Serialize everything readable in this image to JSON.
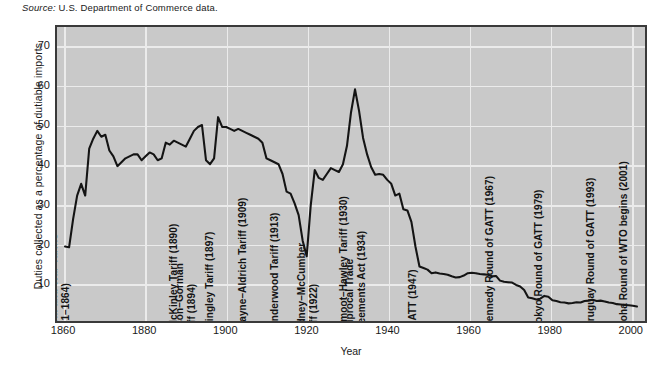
{
  "source_note": {
    "prefix": "Source:",
    "text": " U.S. Department of Commerce data."
  },
  "axes": {
    "y_title": "Duties collected as a percentage of dutiable imports",
    "x_title": "Year",
    "y_ticks": [
      "10",
      "20",
      "30",
      "40",
      "50",
      "60",
      "70"
    ],
    "x_ticks": [
      "1860",
      "1880",
      "1900",
      "1920",
      "1940",
      "1960",
      "1980",
      "2000"
    ]
  },
  "colors": {
    "plot_background": "#c9c9c9",
    "gridline": "#ebebeb",
    "border": "#3a3a3a",
    "series_line": "#141414",
    "text": "#1a1a1a"
  },
  "annotations": [
    {
      "label": "Morrill and War Tariffs\n(1861–1864)",
      "year": 1862,
      "lines": 2
    },
    {
      "label": "McKinley Tariff (1890)",
      "year": 1888,
      "lines": 1
    },
    {
      "label": "Wilson–Gorman\nTariff (1894)",
      "year": 1893,
      "lines": 2
    },
    {
      "label": "Dingley Tariff (1897)",
      "year": 1897,
      "lines": 1
    },
    {
      "label": "Payne–Aldrich Tariff (1909)",
      "year": 1905,
      "lines": 1
    },
    {
      "label": "Underwood Tariff (1913)",
      "year": 1913,
      "lines": 1
    },
    {
      "label": "Fordney–McCumber\nTariff (1922)",
      "year": 1923,
      "lines": 2
    },
    {
      "label": "Smoot–Hawley Tariff (1930)",
      "year": 1930,
      "lines": 1
    },
    {
      "label": "Reciprocal Trade\nAgreements Act (1934)",
      "year": 1935,
      "lines": 2
    },
    {
      "label": "GATT (1947)",
      "year": 1947,
      "lines": 1
    },
    {
      "label": "Kennedy Round of GATT (1967)",
      "year": 1966,
      "lines": 1
    },
    {
      "label": "Tokyo Round of GATT (1979)",
      "year": 1978,
      "lines": 1
    },
    {
      "label": "Uruguay Round of GATT (1993)",
      "year": 1991,
      "lines": 1
    },
    {
      "label": "Doha Round of WTO begins (2001)",
      "year": 1999,
      "lines": 1
    }
  ],
  "chart_data": {
    "type": "line",
    "title": "",
    "subtitle": "",
    "xlabel": "Year",
    "ylabel": "Duties collected as a percentage of dutiable imports",
    "xlim": [
      1858,
      2004
    ],
    "ylim": [
      0,
      75
    ],
    "grid": true,
    "legend_position": "none",
    "x_tick_values": [
      1860,
      1880,
      1900,
      1920,
      1940,
      1960,
      1980,
      2000
    ],
    "y_tick_values": [
      10,
      20,
      30,
      40,
      50,
      60,
      70
    ],
    "series": [
      {
        "name": "Duties collected as a percentage of dutiable imports",
        "x": [
          1860,
          1861,
          1862,
          1863,
          1864,
          1865,
          1866,
          1867,
          1868,
          1869,
          1870,
          1871,
          1872,
          1873,
          1874,
          1875,
          1876,
          1877,
          1878,
          1879,
          1880,
          1881,
          1882,
          1883,
          1884,
          1885,
          1886,
          1887,
          1888,
          1889,
          1890,
          1891,
          1892,
          1893,
          1894,
          1895,
          1896,
          1897,
          1898,
          1899,
          1900,
          1901,
          1902,
          1903,
          1904,
          1905,
          1906,
          1907,
          1908,
          1909,
          1910,
          1911,
          1912,
          1913,
          1914,
          1915,
          1916,
          1917,
          1918,
          1919,
          1920,
          1921,
          1922,
          1923,
          1924,
          1925,
          1926,
          1927,
          1928,
          1929,
          1930,
          1931,
          1932,
          1933,
          1934,
          1935,
          1936,
          1937,
          1938,
          1939,
          1940,
          1941,
          1942,
          1943,
          1944,
          1945,
          1946,
          1947,
          1948,
          1949,
          1950,
          1951,
          1952,
          1953,
          1954,
          1955,
          1956,
          1957,
          1958,
          1959,
          1960,
          1961,
          1962,
          1963,
          1964,
          1965,
          1966,
          1967,
          1968,
          1969,
          1970,
          1971,
          1972,
          1973,
          1974,
          1975,
          1976,
          1977,
          1978,
          1979,
          1980,
          1981,
          1982,
          1983,
          1984,
          1985,
          1986,
          1987,
          1988,
          1989,
          1990,
          1991,
          1992,
          1993,
          1994,
          1995,
          1996,
          1997,
          1998,
          1999,
          2000,
          2001,
          2002
        ],
        "y": [
          19.0,
          18.8,
          26.0,
          32.0,
          35.0,
          32.0,
          44.0,
          46.5,
          48.5,
          47.0,
          47.5,
          43.5,
          42.0,
          39.5,
          40.5,
          41.5,
          42.0,
          42.5,
          42.5,
          41.0,
          42.0,
          43.0,
          42.5,
          41.0,
          41.5,
          45.5,
          45.0,
          46.0,
          45.5,
          45.0,
          44.5,
          46.5,
          48.5,
          49.5,
          50.0,
          41.0,
          40.0,
          41.5,
          52.0,
          49.5,
          49.5,
          49.0,
          48.5,
          49.0,
          48.5,
          48.0,
          47.5,
          47.0,
          46.5,
          45.5,
          41.5,
          41.0,
          40.5,
          40.0,
          37.5,
          33.0,
          32.5,
          30.0,
          27.0,
          20.5,
          16.5,
          29.5,
          38.5,
          36.5,
          36.0,
          37.5,
          39.0,
          38.5,
          38.0,
          40.0,
          44.7,
          53.2,
          59.1,
          53.6,
          46.7,
          42.5,
          39.3,
          37.3,
          37.5,
          37.3,
          36.0,
          35.0,
          32.0,
          32.5,
          28.5,
          28.2,
          25.3,
          19.0,
          13.9,
          13.5,
          13.1,
          12.2,
          12.4,
          12.1,
          12.0,
          11.8,
          11.4,
          11.1,
          11.2,
          11.6,
          12.2,
          12.3,
          12.2,
          12.0,
          11.9,
          11.8,
          11.4,
          11.5,
          10.3,
          10.0,
          9.9,
          9.8,
          9.2,
          8.8,
          7.9,
          6.0,
          5.8,
          5.5,
          5.7,
          6.4,
          6.2,
          5.3,
          5.1,
          4.8,
          4.7,
          4.5,
          4.6,
          4.8,
          4.7,
          5.1,
          5.2,
          5.4,
          5.1,
          5.2,
          5.0,
          4.7,
          4.6,
          4.3,
          4.2,
          4.1,
          4.0,
          3.9,
          3.7
        ]
      }
    ]
  }
}
